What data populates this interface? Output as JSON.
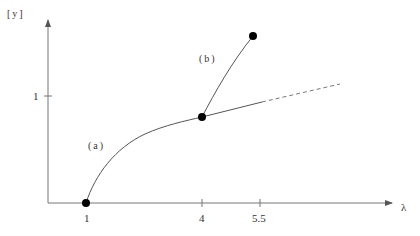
{
  "diagram": {
    "y_axis_label": "[y]",
    "x_axis_label": "λ",
    "y_ticks": [
      {
        "label": "1",
        "value": 1
      }
    ],
    "x_ticks": [
      {
        "label": "1",
        "value": 1
      },
      {
        "label": "4",
        "value": 4
      },
      {
        "label": "5.5",
        "value": 5.5
      }
    ],
    "branches": [
      {
        "label": "(a)",
        "description": "solid curve from λ=1 (y=0) through λ=4, continuing as dashed line"
      },
      {
        "label": "(b)",
        "description": "solid curve from λ=4 point up to endpoint near λ=5.5"
      }
    ],
    "points": [
      {
        "lambda": 1,
        "y": 0
      },
      {
        "lambda": 4,
        "y": 0.85
      },
      {
        "lambda": 5.5,
        "y": 1.7
      }
    ],
    "colors": {
      "line": "#555555",
      "point": "#000000",
      "text": "#333333"
    }
  }
}
